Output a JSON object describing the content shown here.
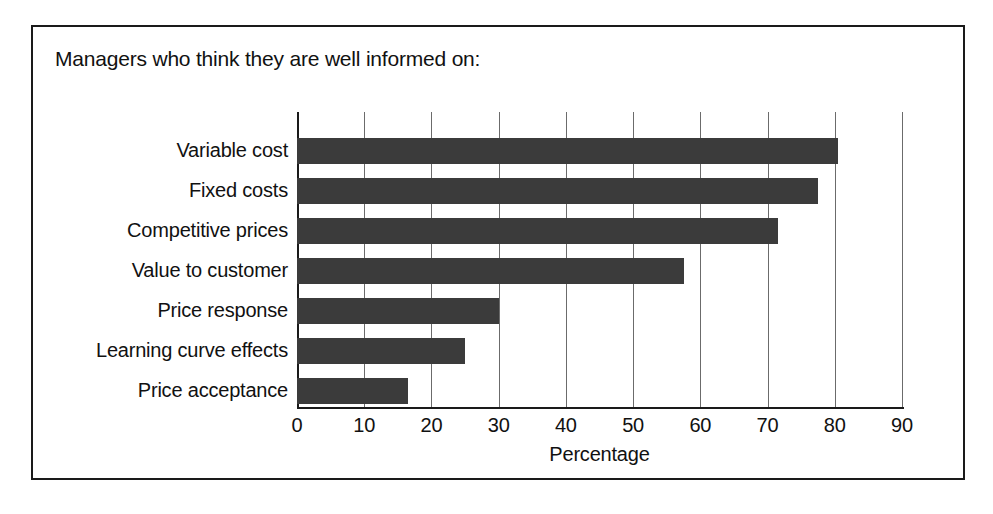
{
  "figure": {
    "border_color": "#1a1a1a",
    "background": "#ffffff"
  },
  "chart_data": {
    "type": "bar",
    "orientation": "horizontal",
    "title": "Managers who think they are well informed on:",
    "xlabel": "Percentage",
    "ylabel": "",
    "categories": [
      "Variable cost",
      "Fixed costs",
      "Competitive prices",
      "Value to customer",
      "Price response",
      "Learning curve effects",
      "Price acceptance"
    ],
    "values": [
      80.5,
      77.5,
      71.5,
      57.5,
      30,
      25,
      16.5
    ],
    "xlim": [
      0,
      90
    ],
    "xticks": [
      0,
      10,
      20,
      30,
      40,
      50,
      60,
      70,
      80,
      90
    ],
    "xtick_labels": [
      "0",
      "10",
      "20",
      "30",
      "40",
      "50",
      "60",
      "70",
      "80",
      "90"
    ],
    "grid": "vertical",
    "legend": "none",
    "bar_color": "#3b3b3b",
    "gridline_color": "#6b6b6b",
    "axis_color": "#1a1a1a"
  }
}
